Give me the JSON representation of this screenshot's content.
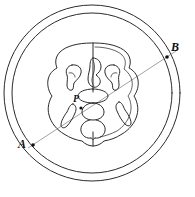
{
  "figure": {
    "kind": "anatomical-cross-section-diagram",
    "caption": "",
    "background_color": "#ffffff",
    "line_color": "#2b2b2b",
    "chord_color": "#8a8a8a",
    "point_color": "#111111"
  },
  "labels": {
    "A": "A",
    "B": "B",
    "P": "P"
  },
  "points": {
    "A": {
      "label": "A",
      "x": 33,
      "y": 145
    },
    "B": {
      "label": "B",
      "x": 167,
      "y": 57
    },
    "P": {
      "label": "P",
      "x": 81,
      "y": 108
    }
  },
  "circles": {
    "outer": {
      "cx": 92,
      "cy": 93,
      "r": 88
    },
    "inner": {
      "cx": 92,
      "cy": 93,
      "r": 80
    }
  },
  "chord": {
    "x1": 28,
    "y1": 148,
    "x2": 176,
    "y2": 51
  }
}
